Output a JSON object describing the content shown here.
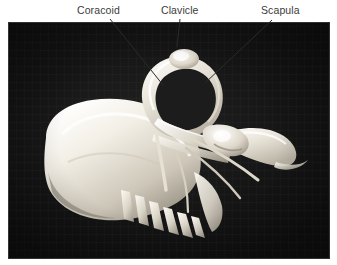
{
  "figure": {
    "caption_type": "anatomical-photo-with-callouts",
    "background_color": "#ffffff",
    "photo": {
      "backdrop_color": "#161616",
      "bone_color": "#f2efe8",
      "x": 8,
      "y": 22,
      "width": 322,
      "height": 237
    },
    "label_color": "#3b3b3b",
    "leader_line_color": "#2a2a2a",
    "labels": [
      {
        "id": "coracoid",
        "text": "Coracoid",
        "x": 77,
        "y": 4,
        "leader": {
          "x1": 110,
          "y1": 19,
          "x2": 163,
          "y2": 85
        }
      },
      {
        "id": "clavicle",
        "text": "Clavicle",
        "x": 161,
        "y": 4,
        "leader": {
          "x1": 180,
          "y1": 19,
          "x2": 177,
          "y2": 47
        }
      },
      {
        "id": "scapula",
        "text": "Scapula",
        "x": 261,
        "y": 4,
        "leader": {
          "x1": 272,
          "y1": 20,
          "x2": 205,
          "y2": 83
        }
      }
    ]
  }
}
